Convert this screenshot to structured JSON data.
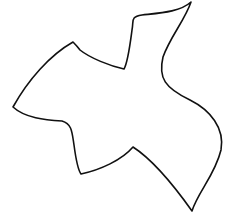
{
  "figure": {
    "background_color": "#ffffff",
    "stroke_color": "#111111",
    "stroke_width": 1.6
  }
}
